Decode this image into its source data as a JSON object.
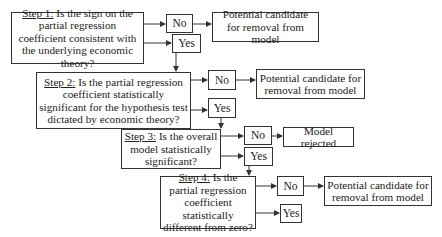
{
  "diagram": {
    "type": "flowchart",
    "steps": [
      {
        "label": "Step 1:",
        "question": " Is the sign on the partial regression coefficient consistent with the underlying economic theory?",
        "no_label": "No",
        "yes_label": "Yes",
        "no_outcome": "Potential candidate for removal from model"
      },
      {
        "label": "Step 2:",
        "question": " Is the partial regression coefficient statistically significant for the hypothesis test dictated by economic theory?",
        "no_label": "No",
        "yes_label": "Yes",
        "no_outcome": "Potential candidate for removal from model"
      },
      {
        "label": "Step 3:",
        "question": " Is the overall model statistically significant?",
        "no_label": "No",
        "yes_label": "Yes",
        "no_outcome": "Model rejected"
      },
      {
        "label": "Step 4:",
        "question": " Is the partial regression coefficient statistically different from zero?",
        "no_label": "No",
        "yes_label": "Yes",
        "no_outcome": "Potential candidate for removal from model"
      }
    ]
  },
  "colors": {
    "line": "#333333",
    "background": "#ffffff",
    "text": "#222222"
  }
}
